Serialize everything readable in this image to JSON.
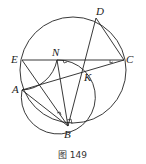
{
  "figure": {
    "caption": "图 149",
    "points": {
      "D": {
        "label": "D",
        "x": 96,
        "y": 18
      },
      "E": {
        "label": "E",
        "x": 22,
        "y": 60
      },
      "N": {
        "label": "N",
        "x": 57,
        "y": 60
      },
      "C": {
        "label": "C",
        "x": 124,
        "y": 60
      },
      "K": {
        "label": "K",
        "x": 82,
        "y": 71
      },
      "A": {
        "label": "A",
        "x": 22,
        "y": 90
      },
      "B": {
        "label": "B",
        "x": 68,
        "y": 126
      }
    },
    "circles": [
      {
        "name": "large-circle",
        "cx": 73,
        "cy": 70,
        "r": 54
      },
      {
        "name": "small-circle",
        "cx": 60,
        "cy": 89,
        "r": 37
      }
    ],
    "segments": [
      "EC",
      "DC",
      "DB",
      "AC",
      "AB",
      "EB",
      "NB"
    ],
    "right_angle_marks": [
      "at N on NK",
      "at C on KC",
      "at B (NB)",
      "on EB near B"
    ],
    "stroke_color": "#222222"
  }
}
